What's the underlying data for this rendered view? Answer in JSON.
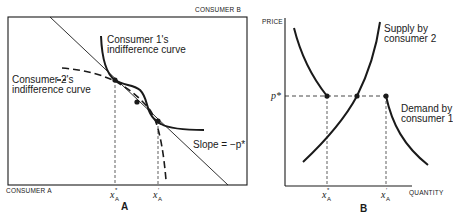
{
  "figure": {
    "panel_a": {
      "panel_label": "A",
      "corner_top_right_label": "CONSUMER B",
      "corner_bottom_left_label": "CONSUMER A",
      "curves": {
        "consumer1_label_line1": "Consumer 1's",
        "consumer1_label_line2": "indifference curve",
        "consumer2_label_line1": "Consumer 2's",
        "consumer2_label_line2": "indifference curve",
        "slope_label": "Slope = −p*"
      },
      "x_ticks": [
        {
          "symbol": "x",
          "superscript": "*",
          "subscript": "A"
        },
        {
          "symbol": "x",
          "superscript": "′",
          "subscript": "A"
        }
      ]
    },
    "panel_b": {
      "panel_label": "B",
      "y_axis_label": "PRICE",
      "x_axis_label": "QUANTITY",
      "price_label": "p*",
      "supply_label_line1": "Supply by",
      "supply_label_line2": "consumer 2",
      "demand_label_line1": "Demand by",
      "demand_label_line2": "consumer 1",
      "x_ticks": [
        {
          "symbol": "x",
          "superscript": "*",
          "subscript": "A"
        },
        {
          "symbol": "x",
          "superscript": "′",
          "subscript": "A"
        }
      ]
    },
    "colors": {
      "ink": "#1a1a1a",
      "background": "#ffffff"
    }
  }
}
